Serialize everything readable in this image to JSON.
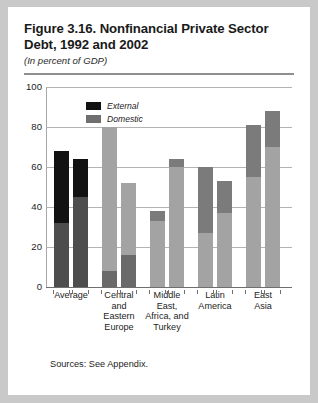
{
  "figure": {
    "title": "Figure 3.16. Nonfinancial Private Sector Debt, 1992 and 2002",
    "subtitle": "(In percent of GDP)",
    "sources": "Sources: See Appendix."
  },
  "colors": {
    "external_dark": "#121212",
    "external_gray": "#7b7b7b",
    "domestic_dark": "#4d4d4d",
    "domestic_gray": "#a3a3a3",
    "gridline": "#b3b3b3",
    "axis": "#6f6f6f",
    "page_background": "#c9c9c9",
    "card_background": "#ffffff",
    "rule": "#8e8e8e"
  },
  "chart_data": {
    "type": "bar",
    "subtype": "stacked-grouped",
    "title": "Figure 3.16. Nonfinancial Private Sector Debt, 1992 and 2002",
    "subtitle": "(In percent of GDP)",
    "xlabel": "",
    "ylabel": "",
    "ylim": [
      0,
      100
    ],
    "yticks": [
      0,
      20,
      40,
      60,
      80,
      100
    ],
    "ytick_labels": [
      "0",
      "20",
      "40",
      "60",
      "80",
      "100"
    ],
    "grid": true,
    "grid_axis": "y",
    "legend": [
      "External",
      "Domestic"
    ],
    "legend_position": "upper-left-inside",
    "categories": [
      "Average",
      "Central and Eastern Europe",
      "Middle East, Africa, and Turkey",
      "Latin America",
      "East Asia"
    ],
    "category_lines": [
      [
        "Average"
      ],
      [
        "Central",
        "and",
        "Eastern",
        "Europe"
      ],
      [
        "Middle",
        "East,",
        "Africa, and",
        "Turkey"
      ],
      [
        "Latin",
        "America"
      ],
      [
        "East",
        "Asia"
      ]
    ],
    "bar_years": [
      "1992",
      "2002"
    ],
    "series": [
      {
        "name": "Domestic",
        "values": [
          [
            32,
            45
          ],
          [
            8,
            16
          ],
          [
            33,
            60
          ],
          [
            27,
            37
          ],
          [
            55,
            70
          ]
        ]
      },
      {
        "name": "External",
        "values": [
          [
            36,
            19
          ],
          [
            72,
            36
          ],
          [
            5,
            4
          ],
          [
            33,
            16
          ],
          [
            26,
            18
          ]
        ]
      }
    ],
    "totals": [
      [
        68,
        64
      ],
      [
        80,
        52
      ],
      [
        38,
        64
      ],
      [
        60,
        53
      ],
      [
        81,
        88
      ]
    ],
    "note": "Each group shows two stacked bars: left = 1992, right = 2002. Lower segment is Domestic, upper segment is External."
  },
  "bars": [
    {
      "group": "Average",
      "x": 8,
      "items": [
        {
          "x": 0,
          "total": 68,
          "lower": 32,
          "lower_color": "#4d4d4d",
          "upper_color": "#121212"
        },
        {
          "x": 19,
          "total": 64,
          "lower": 45,
          "lower_color": "#4d4d4d",
          "upper_color": "#121212"
        }
      ]
    },
    {
      "group": "Central and Eastern Europe",
      "x": 56,
      "items": [
        {
          "x": 0,
          "total": 80,
          "lower": 8,
          "lower_color": "#6a6a6a",
          "upper_color": "#a3a3a3"
        },
        {
          "x": 19,
          "total": 52,
          "lower": 16,
          "lower_color": "#6a6a6a",
          "upper_color": "#a3a3a3"
        }
      ]
    },
    {
      "group": "Middle East, Africa, and Turkey",
      "x": 104,
      "items": [
        {
          "x": 0,
          "total": 38,
          "lower": 33,
          "lower_color": "#a3a3a3",
          "upper_color": "#7b7b7b"
        },
        {
          "x": 19,
          "total": 64,
          "lower": 60,
          "lower_color": "#a3a3a3",
          "upper_color": "#7b7b7b"
        }
      ]
    },
    {
      "group": "Latin America",
      "x": 152,
      "items": [
        {
          "x": 0,
          "total": 60,
          "lower": 27,
          "lower_color": "#a3a3a3",
          "upper_color": "#7b7b7b"
        },
        {
          "x": 19,
          "total": 53,
          "lower": 37,
          "lower_color": "#a3a3a3",
          "upper_color": "#7b7b7b"
        }
      ]
    },
    {
      "group": "East Asia",
      "x": 200,
      "items": [
        {
          "x": 0,
          "total": 81,
          "lower": 55,
          "lower_color": "#a3a3a3",
          "upper_color": "#7b7b7b"
        },
        {
          "x": 19,
          "total": 88,
          "lower": 70,
          "lower_color": "#a3a3a3",
          "upper_color": "#7b7b7b"
        }
      ]
    }
  ],
  "legend_items": [
    {
      "label": "External",
      "color": "#121212"
    },
    {
      "label": "Domestic",
      "color": "#6f6f6f"
    }
  ]
}
